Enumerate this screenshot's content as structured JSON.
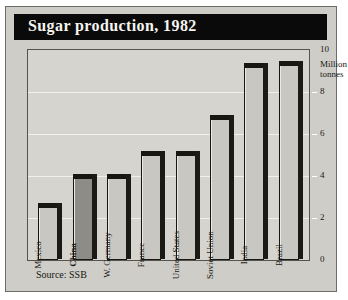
{
  "title": "Sugar production, 1982",
  "source": "Source: SSB",
  "axis": {
    "unit_line1": "Million",
    "unit_line2": "tonnes",
    "ticks": [
      "10",
      "8",
      "6",
      "4",
      "2",
      "0"
    ]
  },
  "chart_data": {
    "type": "bar",
    "title": "Sugar production, 1982",
    "xlabel": "",
    "ylabel": "Million tonnes",
    "ylim": [
      0,
      10
    ],
    "yticks": [
      0,
      2,
      4,
      6,
      8,
      10
    ],
    "grid": true,
    "legend": false,
    "note": "Source: SSB",
    "categories": [
      "Mexico",
      "China",
      "W. Germany",
      "France",
      "United States",
      "Soviet Union",
      "India",
      "Brazil"
    ],
    "values": [
      2.5,
      3.9,
      3.9,
      5.0,
      5.0,
      6.7,
      9.2,
      9.3
    ],
    "highlight": "China",
    "highlight_color": "#8e8c87",
    "bar_color": "#c9c7c2"
  }
}
